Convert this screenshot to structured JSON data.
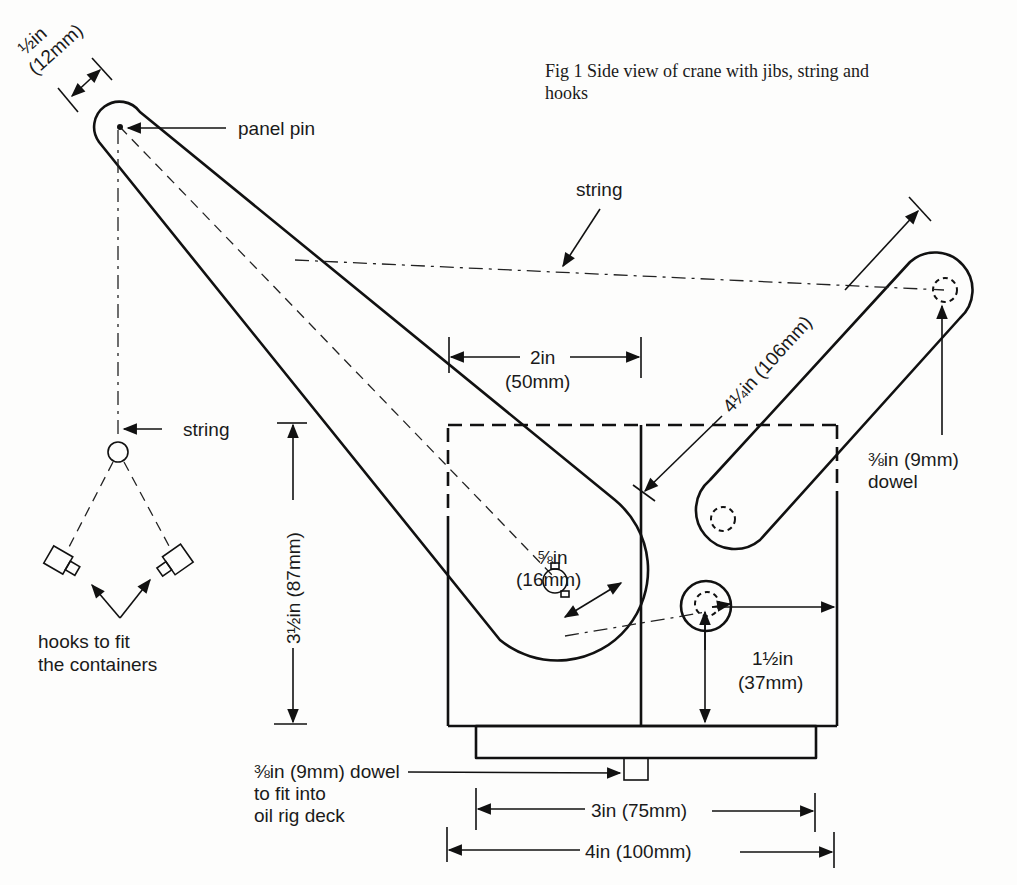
{
  "caption": {
    "line1": "Fig 1 Side view of crane with jibs, string and",
    "line2": "hooks"
  },
  "labels": {
    "jib_width_in": "½in",
    "jib_width_mm": "(12mm)",
    "panel_pin": "panel pin",
    "string_top": "string",
    "string_left": "string",
    "hooks_line1": "hooks to fit",
    "hooks_line2": "the containers",
    "width_2in": "2in",
    "width_50mm": "(50mm)",
    "height_label": "3½in (87mm)",
    "jib_length_label": "4¼in (106mm)",
    "dowel_right_1": "⅜in (9mm)",
    "dowel_right_2": "dowel",
    "pivot_radius_in": "⅝in",
    "pivot_radius_mm": "(16mm)",
    "offset_in": "1½in",
    "offset_mm": "(37mm)",
    "base_dowel_1": "⅜in (9mm) dowel",
    "base_dowel_2": "to fit into",
    "base_dowel_3": "oil rig deck",
    "dim_3in": "3in (75mm)",
    "dim_4in": "4in (100mm)"
  }
}
